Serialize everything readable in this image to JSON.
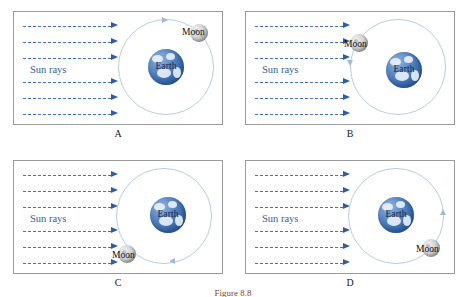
{
  "figure": {
    "caption": "Figure 8.8",
    "sun_rays_label": "Sun rays",
    "earth_label": "Earth",
    "moon_label": "Moon",
    "ray_count": 6,
    "orbit_color": "#b9cbe4",
    "ray_color": "#4472b8",
    "ray_head_color": "#2d5ca8",
    "earth_color": "#3a6cae",
    "moon_color": "#c9c9c9",
    "caption_color": "#8d3b2a"
  },
  "panels": [
    {
      "id": "a",
      "label": "A",
      "sun_rays_label": "Sun rays",
      "earth_label": "Earth",
      "moon_label": "Moon",
      "moon_position": "upper-right",
      "moon_angle_deg": 52,
      "orbit_arrow_position": "top",
      "orbit_direction": "counterclockwise"
    },
    {
      "id": "b",
      "label": "B",
      "sun_rays_label": "Sun rays",
      "earth_label": "Earth",
      "moon_label": "Moon",
      "moon_position": "upper-left",
      "moon_angle_deg": 140,
      "orbit_arrow_position": "left",
      "orbit_direction": "counterclockwise"
    },
    {
      "id": "c",
      "label": "C",
      "sun_rays_label": "Sun rays",
      "earth_label": "Earth",
      "moon_label": "Moon",
      "moon_position": "lower-left",
      "moon_angle_deg": 218,
      "orbit_arrow_position": "bottom",
      "orbit_direction": "counterclockwise"
    },
    {
      "id": "d",
      "label": "D",
      "sun_rays_label": "Sun rays",
      "earth_label": "Earth",
      "moon_label": "Moon",
      "moon_position": "lower-right",
      "moon_angle_deg": 315,
      "orbit_arrow_position": "right",
      "orbit_direction": "counterclockwise"
    }
  ]
}
